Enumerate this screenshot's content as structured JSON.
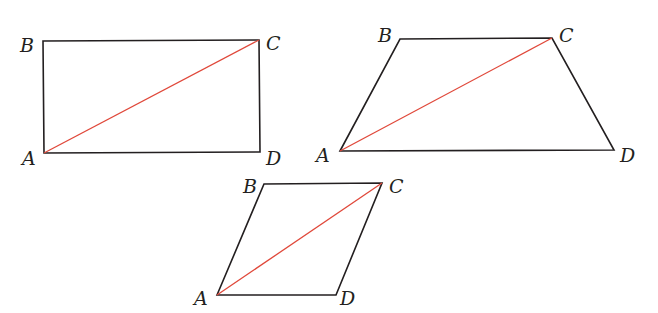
{
  "figure": {
    "diagonal_color": "#e0483a",
    "edge_color": "#231f20",
    "shapes": [
      {
        "name": "rectangle",
        "vertices": {
          "A": {
            "label": "A",
            "x": 44,
            "y": 153,
            "lx": 22,
            "ly": 165
          },
          "B": {
            "label": "B",
            "x": 43,
            "y": 41,
            "lx": 20,
            "ly": 52
          },
          "C": {
            "label": "C",
            "x": 259,
            "y": 40,
            "lx": 266,
            "ly": 50
          },
          "D": {
            "label": "D",
            "x": 260,
            "y": 152,
            "lx": 266,
            "ly": 165
          }
        }
      },
      {
        "name": "trapezoid",
        "vertices": {
          "A": {
            "label": "A",
            "x": 340,
            "y": 151,
            "lx": 316,
            "ly": 162
          },
          "B": {
            "label": "B",
            "x": 400,
            "y": 39,
            "lx": 378,
            "ly": 42
          },
          "C": {
            "label": "C",
            "x": 552,
            "y": 38,
            "lx": 559,
            "ly": 42
          },
          "D": {
            "label": "D",
            "x": 614,
            "y": 150,
            "lx": 620,
            "ly": 162
          }
        }
      },
      {
        "name": "parallelogram",
        "vertices": {
          "A": {
            "label": "A",
            "x": 217,
            "y": 295,
            "lx": 194,
            "ly": 305
          },
          "B": {
            "label": "B",
            "x": 264,
            "y": 184,
            "lx": 243,
            "ly": 193
          },
          "C": {
            "label": "C",
            "x": 382,
            "y": 183,
            "lx": 389,
            "ly": 193
          },
          "D": {
            "label": "D",
            "x": 336,
            "y": 295,
            "lx": 340,
            "ly": 305
          }
        }
      }
    ]
  }
}
